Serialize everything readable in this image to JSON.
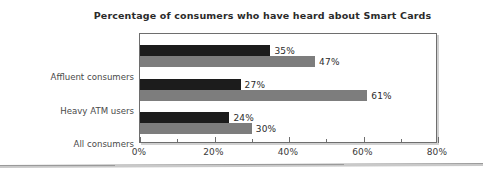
{
  "chart_data": {
    "type": "bar",
    "orientation": "horizontal",
    "title": "Percentage of consumers who have heard about Smart Cards",
    "xlabel": "",
    "ylabel": "",
    "xlim": [
      0,
      80
    ],
    "grid": false,
    "legend": "none",
    "tick_labels": [
      "0%",
      "20%",
      "40%",
      "60%",
      "80%"
    ],
    "tick_values": [
      0,
      20,
      40,
      60,
      80
    ],
    "minor_tick_values": [
      10,
      30,
      50,
      70
    ],
    "categories": [
      "Affluent consumers",
      "Heavy ATM users",
      "All consumers"
    ],
    "series": [
      {
        "name": "Series 1",
        "color": "#1c1c1c",
        "values": [
          35,
          27,
          24
        ],
        "value_labels": [
          "35%",
          "27%",
          "24%"
        ]
      },
      {
        "name": "Series 2",
        "color": "#7d7d7d",
        "values": [
          47,
          61,
          30
        ],
        "value_labels": [
          "47%",
          "61%",
          "30%"
        ]
      }
    ]
  }
}
